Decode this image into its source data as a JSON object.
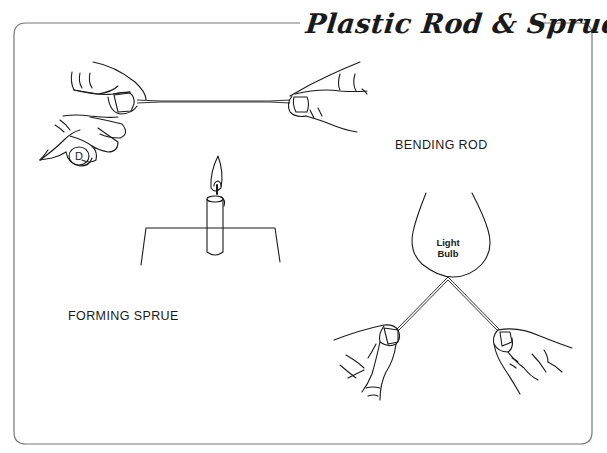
{
  "title": "Plastic Rod & Sprue",
  "sections": {
    "bending_rod": {
      "label": "BENDING ROD"
    },
    "forming_sprue": {
      "label": "FORMING SPRUE"
    }
  },
  "bulb": {
    "line1": "Light",
    "line2": "Bulb"
  },
  "thumbnail_mark": "D",
  "colors": {
    "ink": "#1a1a1a",
    "frame": "#777777",
    "background": "#ffffff"
  }
}
